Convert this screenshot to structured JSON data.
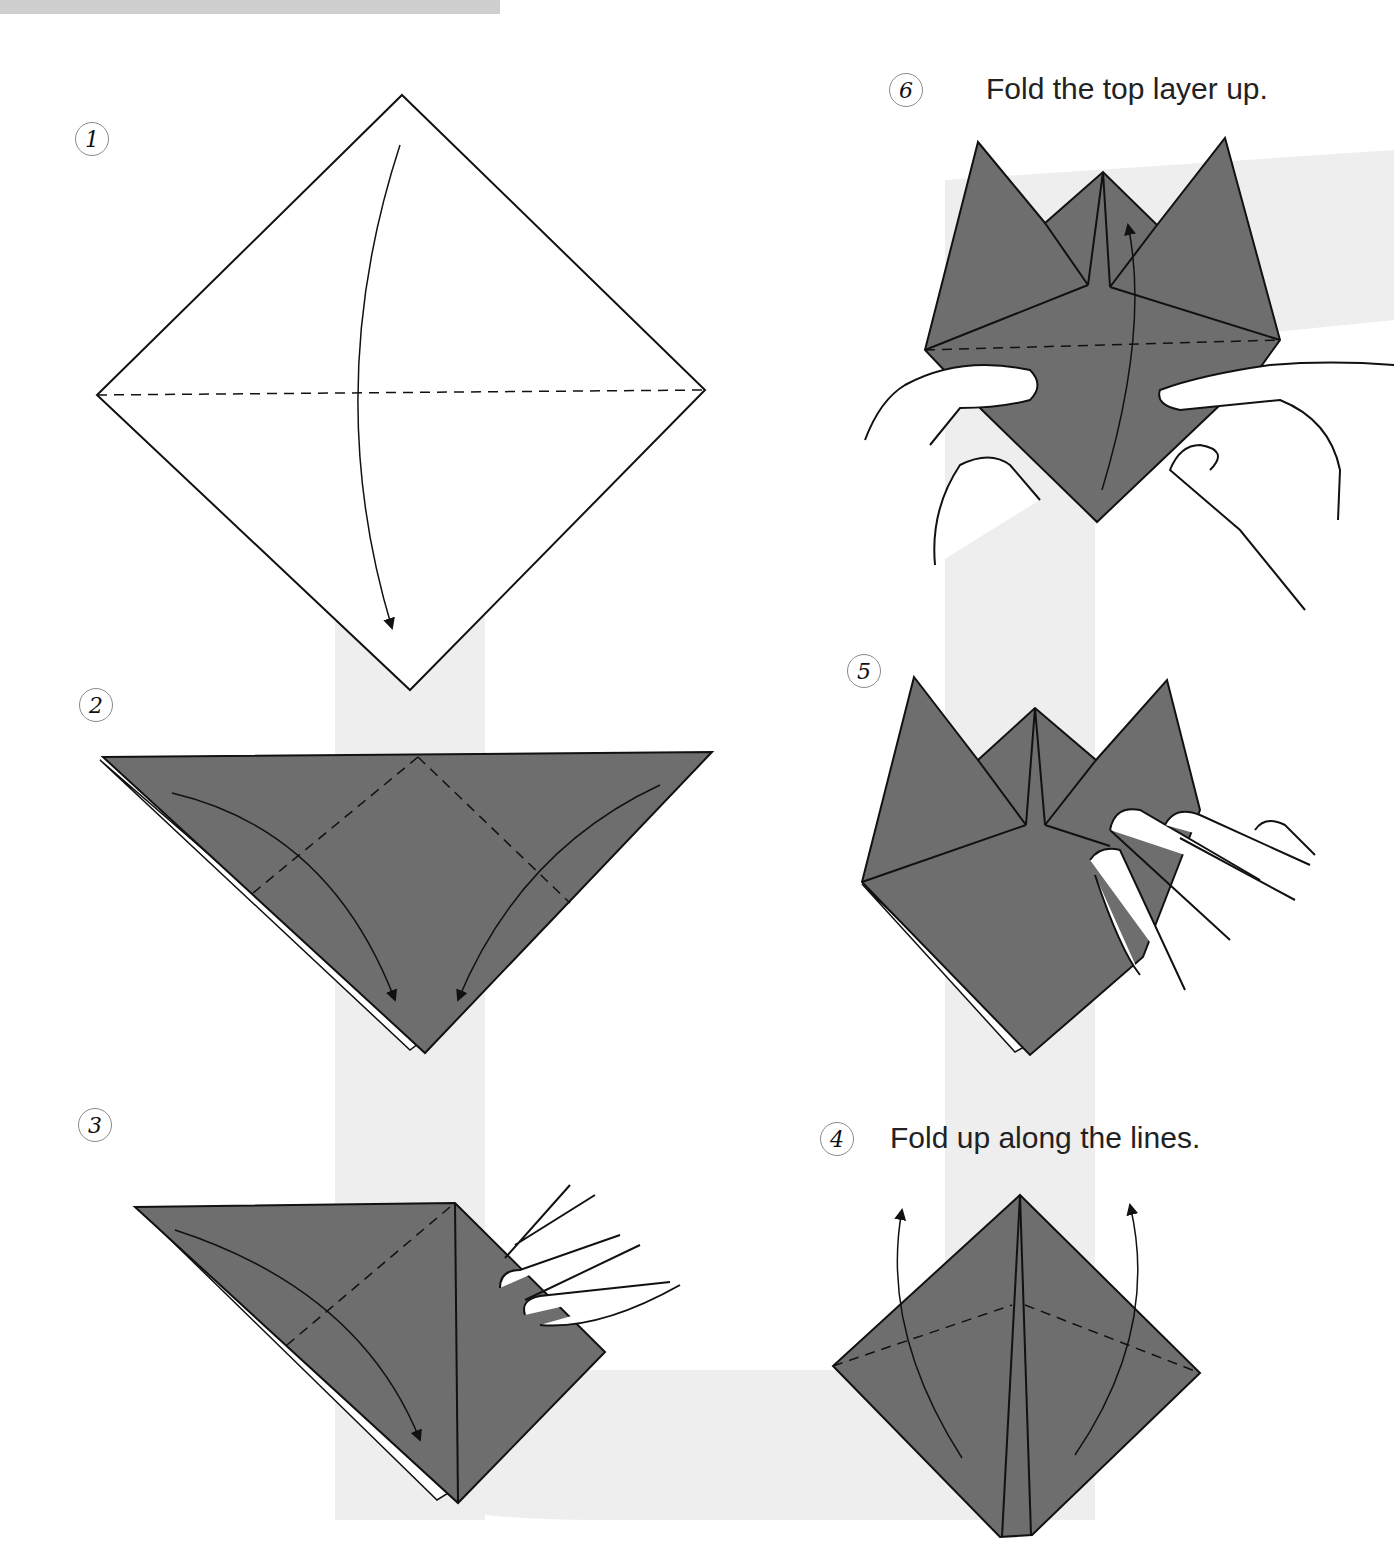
{
  "page": {
    "type": "origami-instructions",
    "colors": {
      "paper_color": "#6e6e6e",
      "paper_back": "#ffffff",
      "outline": "#111111",
      "guide_band": "#eeeeee",
      "step_circle": "#8a8a8a",
      "text": "#222222"
    }
  },
  "steps": [
    {
      "number": "1",
      "instruction": ""
    },
    {
      "number": "2",
      "instruction": ""
    },
    {
      "number": "3",
      "instruction": ""
    },
    {
      "number": "4",
      "instruction": "Fold up along the lines."
    },
    {
      "number": "5",
      "instruction": ""
    },
    {
      "number": "6",
      "instruction": "Fold the top layer up."
    }
  ]
}
